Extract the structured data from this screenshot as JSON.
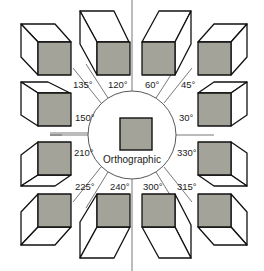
{
  "diagram": {
    "center_label": "Orthographic",
    "colors": {
      "face_fill": "#a3a39a",
      "edge": "#111111",
      "guide": "#555555",
      "background": "#ffffff"
    },
    "angle_labels": [
      {
        "id": "a135",
        "text": "135°"
      },
      {
        "id": "a120",
        "text": "120°"
      },
      {
        "id": "a60",
        "text": "60°"
      },
      {
        "id": "a45",
        "text": "45°"
      },
      {
        "id": "a150",
        "text": "150°"
      },
      {
        "id": "a30",
        "text": "30°"
      },
      {
        "id": "a210",
        "text": "210°"
      },
      {
        "id": "a330",
        "text": "330°"
      },
      {
        "id": "a225",
        "text": "225°"
      },
      {
        "id": "a240",
        "text": "240°"
      },
      {
        "id": "a300",
        "text": "300°"
      },
      {
        "id": "a315",
        "text": "315°"
      }
    ],
    "cubes": [
      {
        "angle": 135,
        "position": "top-left"
      },
      {
        "angle": 120,
        "position": "top-center-left"
      },
      {
        "angle": 60,
        "position": "top-center-right"
      },
      {
        "angle": 45,
        "position": "top-right"
      },
      {
        "angle": 150,
        "position": "upper-left"
      },
      {
        "angle": 30,
        "position": "upper-right"
      },
      {
        "angle": 210,
        "position": "lower-left"
      },
      {
        "angle": 330,
        "position": "lower-right"
      },
      {
        "angle": 225,
        "position": "bottom-left"
      },
      {
        "angle": 240,
        "position": "bottom-center-left"
      },
      {
        "angle": 300,
        "position": "bottom-center-right"
      },
      {
        "angle": 315,
        "position": "bottom-right"
      }
    ]
  }
}
